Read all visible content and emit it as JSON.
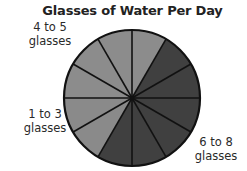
{
  "chart_data": {
    "type": "pie",
    "title": "Glasses of Water Per Day",
    "total_sections": 12,
    "categories": [
      "4 to 5 glasses",
      "6 to 8 glasses",
      "1 to 3 glasses"
    ],
    "values": [
      4,
      6,
      2
    ],
    "fractions": [
      "4/12",
      "6/12",
      "2/12"
    ],
    "colors": [
      "#8c8c8c",
      "#404040",
      "#8a8a8a"
    ],
    "slice_order_clockwise_from_12_oclock": [
      "6 to 8 glasses starts at 1 o'clock",
      "slices: 12-1 light (4 to 5), 1-7 dark (6 to 8), 7-9 light (1 to 3), 9-12 light (4 to 5)"
    ],
    "labels": [
      {
        "line1": "4 to 5",
        "line2": "glasses",
        "position": "upper-left"
      },
      {
        "line1": "1 to 3",
        "line2": "glasses",
        "position": "left"
      },
      {
        "line1": "6 to 8",
        "line2": "glasses",
        "position": "lower-right"
      }
    ],
    "legend": "none",
    "grid": false
  },
  "title": "Glasses of Water Per Day",
  "labels": {
    "four_to_five": {
      "line1": "4 to 5",
      "line2": "glasses"
    },
    "one_to_three": {
      "line1": "1 to 3",
      "line2": "glasses"
    },
    "six_to_eight": {
      "line1": "6 to 8",
      "line2": "glasses"
    }
  },
  "style": {
    "light_color": "#8c8c8c",
    "dark_color": "#404040",
    "outline_color": "#111111"
  }
}
